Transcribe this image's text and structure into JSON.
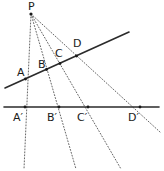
{
  "figure": {
    "type": "geometry-diagram",
    "background_color": "#ffffff",
    "ink_color": "#1a1a1a",
    "ray_color": "#555555"
  },
  "apex": {
    "label": "P",
    "label_x": 28,
    "label_y": 1,
    "point_x": 31,
    "point_y": 14,
    "dot_radius": 1.6
  },
  "transversal_line": {
    "name": "slanted-line",
    "x1": 5,
    "y1": 88,
    "x2": 129,
    "y2": 32,
    "stroke_width": 1.6,
    "color": "#2b2b2b"
  },
  "base_line": {
    "name": "horizontal-line",
    "x1": 4,
    "y1": 107,
    "x2": 159,
    "y2": 107,
    "stroke_width": 1.6,
    "color": "#2b2b2b"
  },
  "rays": [
    {
      "name": "ray-P-A",
      "x1": 31,
      "y1": 14,
      "x2": 24,
      "y2": 169
    },
    {
      "name": "ray-P-B",
      "x1": 31,
      "y1": 14,
      "x2": 76,
      "y2": 169
    },
    {
      "name": "ray-P-C",
      "x1": 31,
      "y1": 14,
      "x2": 121,
      "y2": 169
    },
    {
      "name": "ray-P-D",
      "x1": 31,
      "y1": 14,
      "x2": 160,
      "y2": 132
    }
  ],
  "upper_points": [
    {
      "label": "A",
      "x": 25.5,
      "y": 79,
      "label_x": 17,
      "label_y": 67
    },
    {
      "label": "B",
      "x": 46.5,
      "y": 69.5,
      "label_x": 38,
      "label_y": 59
    },
    {
      "label": "C",
      "x": 60.0,
      "y": 63.5,
      "label_x": 55,
      "label_y": 48
    },
    {
      "label": "D",
      "x": 76.5,
      "y": 56.0,
      "label_x": 73,
      "label_y": 38
    }
  ],
  "lower_points": [
    {
      "label": "A′",
      "x": 25.0,
      "y": 107,
      "label_x": 13,
      "label_y": 112
    },
    {
      "label": "B′",
      "x": 59.0,
      "y": 107,
      "label_x": 47,
      "label_y": 112
    },
    {
      "label": "C′",
      "x": 88.0,
      "y": 107,
      "label_x": 77,
      "label_y": 112
    },
    {
      "label": "D′",
      "x": 140.0,
      "y": 107,
      "label_x": 128,
      "label_y": 112
    }
  ]
}
